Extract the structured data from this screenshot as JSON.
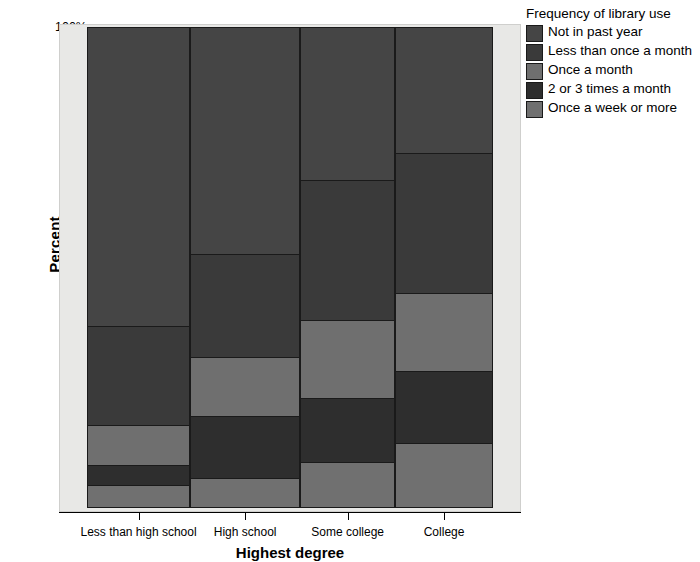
{
  "chart_data": {
    "type": "bar",
    "title": "",
    "xlabel": "Highest degree",
    "ylabel": "Percent",
    "grid": false,
    "stacked": true,
    "normalized": true,
    "legend_position": "right",
    "legend_title": "Frequency of library use",
    "ylim": [
      0,
      100
    ],
    "yticks": [
      "0%",
      "20%",
      "40%",
      "60%",
      "80%",
      "100%"
    ],
    "ytick_values": [
      0,
      20,
      40,
      60,
      80,
      100
    ],
    "categories": [
      "Less than high school",
      "High school",
      "Some college",
      "College"
    ],
    "category_widths_pct": [
      25.4,
      27.1,
      23.4,
      24.1
    ],
    "series": [
      {
        "name": "Not in past year",
        "color": "#454545",
        "values": [
          62.2,
          47.2,
          31.8,
          26.2
        ]
      },
      {
        "name": "Less than once a month",
        "color": "#3a3a3a",
        "values": [
          20.5,
          21.3,
          29.1,
          29.1
        ]
      },
      {
        "name": "Once a month",
        "color": "#6f6f6f",
        "values": [
          8.3,
          12.3,
          16.2,
          16.2
        ]
      },
      {
        "name": "2 or 3 times a month",
        "color": "#2e2e2e",
        "values": [
          4.2,
          12.9,
          13.3,
          15.0
        ]
      },
      {
        "name": "Once a week or more",
        "color": "#707070",
        "values": [
          4.8,
          6.3,
          9.6,
          13.5
        ]
      }
    ],
    "cumulative_boundaries_from_bottom": {
      "Less than high school": [
        4.8,
        9.0,
        17.3,
        37.8,
        100
      ],
      "High school": [
        6.3,
        19.2,
        31.5,
        52.8,
        100
      ],
      "Some college": [
        9.6,
        22.9,
        39.1,
        68.2,
        100
      ],
      "College": [
        13.5,
        28.5,
        44.7,
        73.8,
        100
      ]
    }
  },
  "colors": {
    "plot_background": "#e8e8e6",
    "axis": "#000000",
    "segment_border": "#1a1a1a"
  },
  "legend": {
    "title": "Frequency of library use",
    "items": [
      {
        "label": "Not in past year",
        "color": "#454545"
      },
      {
        "label": "Less than once a month",
        "color": "#3a3a3a"
      },
      {
        "label": "Once a month",
        "color": "#6f6f6f"
      },
      {
        "label": "2 or 3 times a month",
        "color": "#2e2e2e"
      },
      {
        "label": "Once a week or more",
        "color": "#707070"
      }
    ]
  },
  "axes": {
    "y_title": "Percent",
    "x_title": "Highest degree",
    "y_ticks": [
      "100%",
      "80%",
      "60%",
      "40%",
      "20%",
      "0%"
    ],
    "x_ticks": [
      "Less than high school",
      "High school",
      "Some college",
      "College"
    ]
  }
}
